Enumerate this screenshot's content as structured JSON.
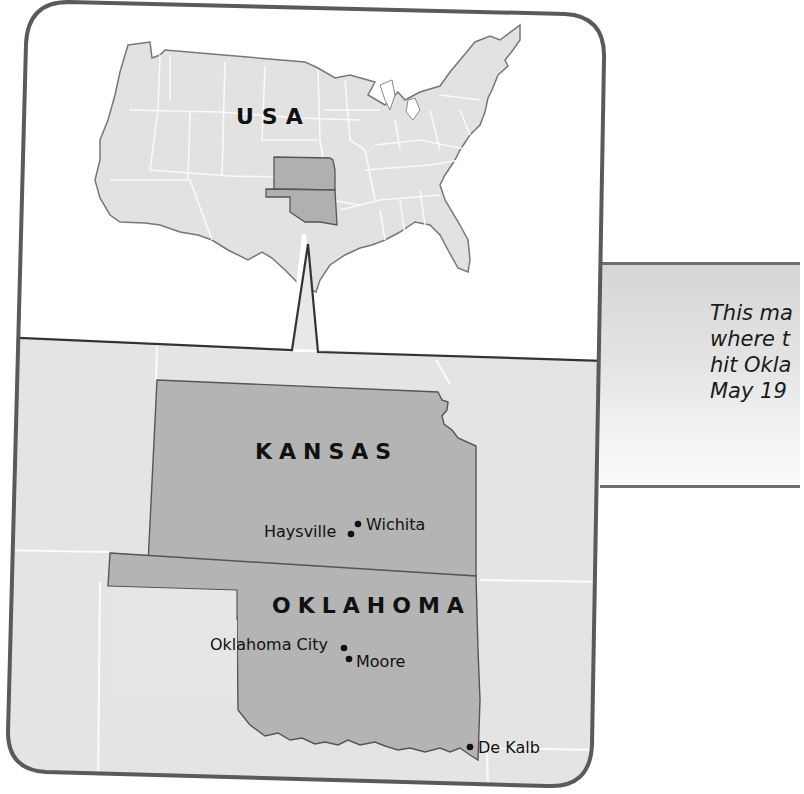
{
  "figure": {
    "type": "locator-map",
    "colors": {
      "frame": "#5a5a5a",
      "land_light": "#e2e2e2",
      "land_highlight": "#b3b3b3",
      "state_border_inner": "#f8f8f8",
      "outline": "#555555",
      "water": "#ffffff",
      "caption_bg": "#dcdcdc"
    }
  },
  "inset_map": {
    "label": "USA",
    "highlighted_states": [
      "Kansas",
      "Oklahoma"
    ]
  },
  "detail_map": {
    "states": [
      {
        "name": "KANSAS"
      },
      {
        "name": "OKLAHOMA"
      }
    ],
    "cities": [
      {
        "name": "Wichita",
        "state": "Kansas"
      },
      {
        "name": "Haysville",
        "state": "Kansas"
      },
      {
        "name": "Oklahoma City",
        "state": "Oklahoma"
      },
      {
        "name": "Moore",
        "state": "Oklahoma"
      },
      {
        "name": "De Kalb",
        "state": "Texas border"
      }
    ]
  },
  "caption": {
    "lines": [
      "This ma",
      "where t",
      "hit Okla",
      "May 19"
    ],
    "text": "This ma\nwhere t\nhit Okla\nMay 19"
  }
}
